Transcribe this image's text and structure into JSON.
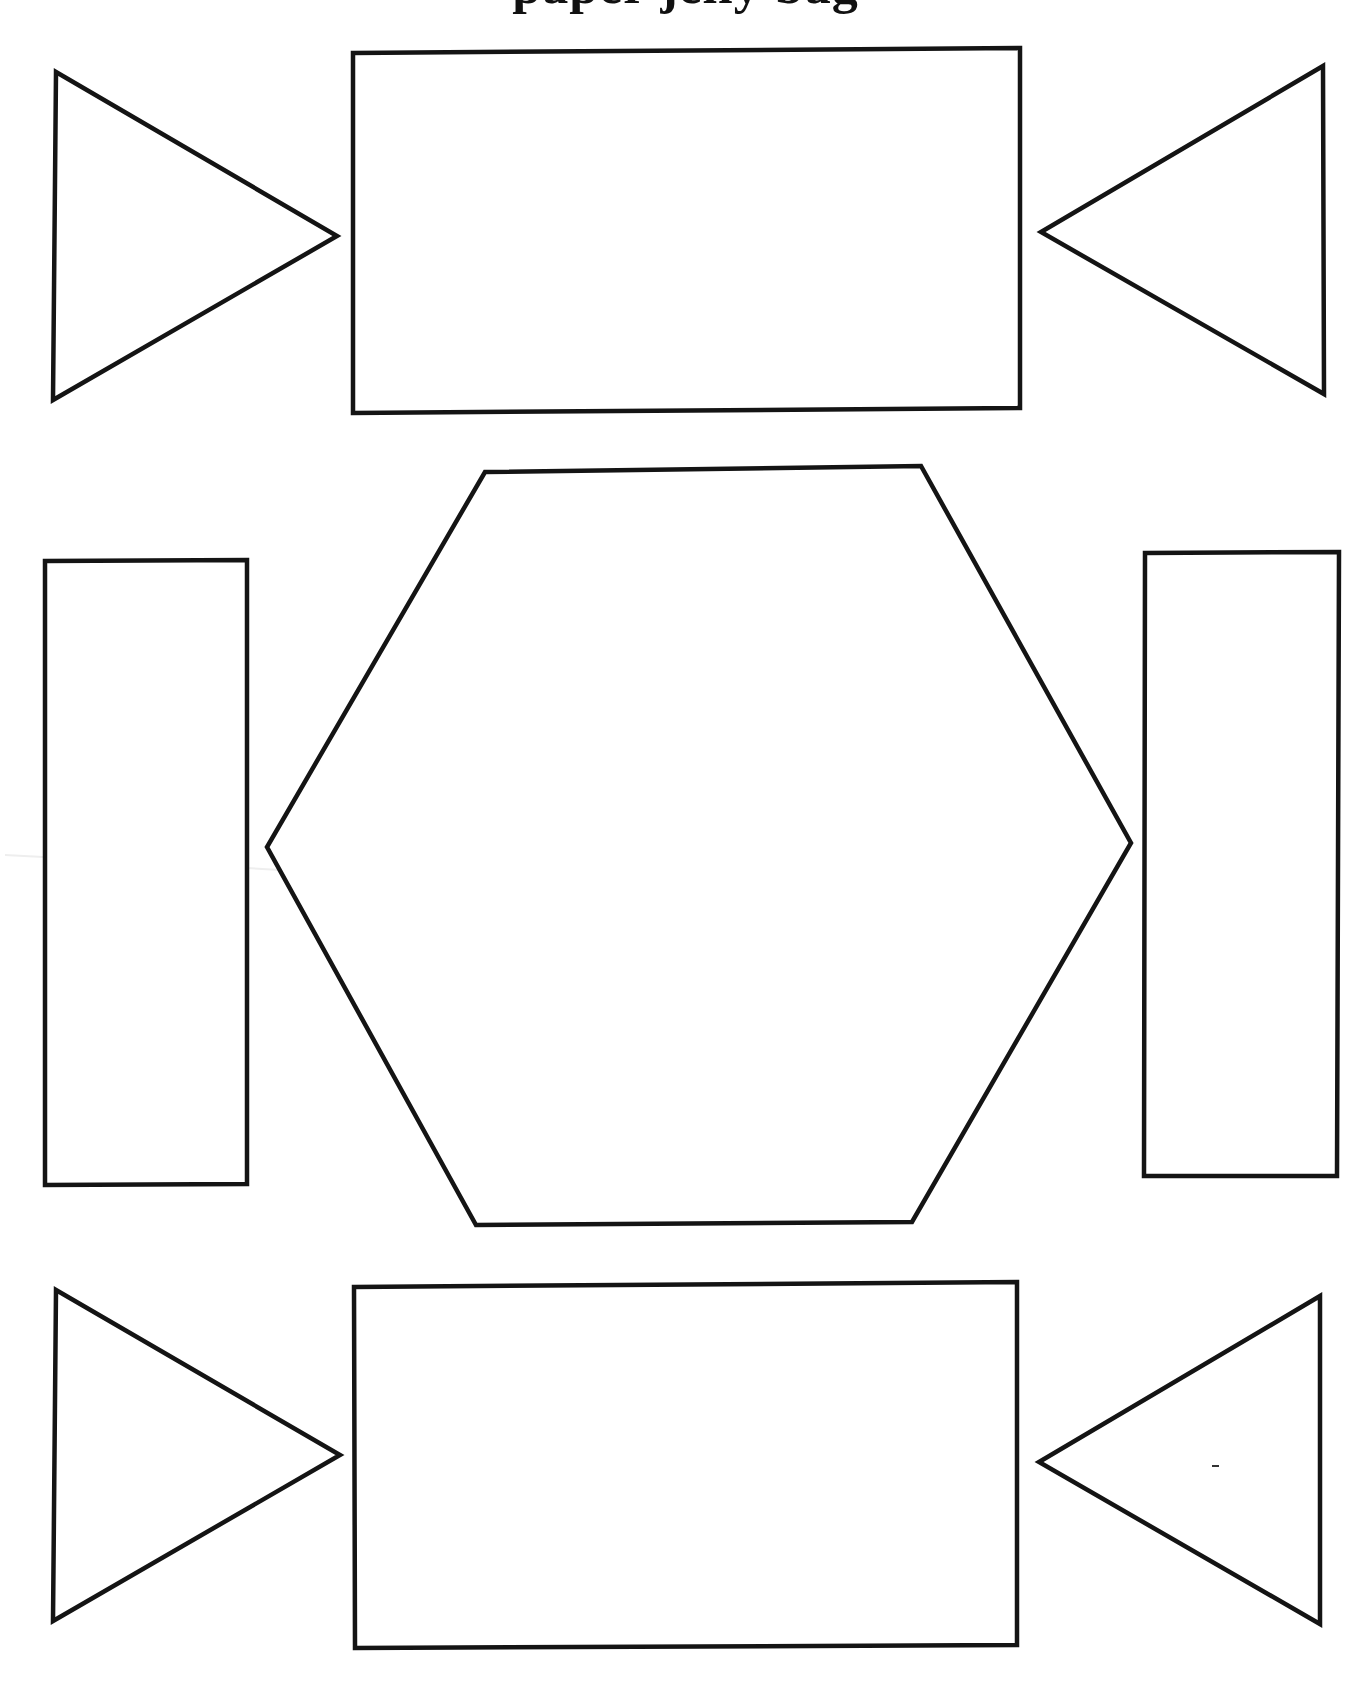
{
  "page": {
    "title": "paper jelly bag",
    "title_note": "title is cropped at top edge; only descenders of letters visible",
    "background": "#ffffff",
    "stroke_color": "#141414"
  },
  "shapes": {
    "top_left_triangle": {
      "type": "triangle",
      "pointing": "right",
      "points": "56,72 337,236 53,400"
    },
    "top_rectangle": {
      "type": "rectangle",
      "points": "353,53 1020,48 1020,408 353,413"
    },
    "top_right_triangle": {
      "type": "triangle",
      "pointing": "left",
      "points": "1323,66 1041,232 1324,394"
    },
    "left_rectangle": {
      "type": "rectangle",
      "points": "45,561 247,560 247,1184 45,1185"
    },
    "center_hexagon": {
      "type": "hexagon",
      "points": "485,472 921,466 1131,843 912,1222 476,1225 267,847"
    },
    "right_rectangle": {
      "type": "rectangle",
      "points": "1145,553 1339,552 1337,1176 1144,1176"
    },
    "bottom_left_triangle": {
      "type": "triangle",
      "pointing": "right",
      "points": "56,1290 340,1455 53,1621"
    },
    "bottom_rectangle": {
      "type": "rectangle",
      "points": "354,1287 1017,1282 1017,1645 355,1648"
    },
    "bottom_right_triangle": {
      "type": "triangle",
      "pointing": "left",
      "points": "1320,1296 1039,1462 1320,1624"
    }
  }
}
